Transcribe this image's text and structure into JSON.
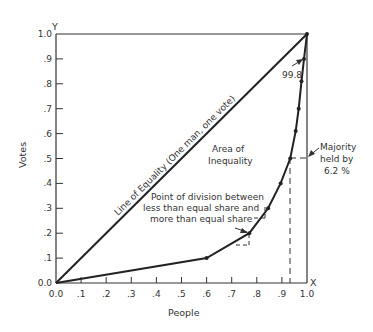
{
  "chart_data": {
    "type": "line",
    "title": "",
    "xlabel": "People",
    "ylabel": "Votes",
    "x_axis_letter": "X",
    "y_axis_letter": "Y",
    "xlim": [
      0,
      1
    ],
    "ylim": [
      0,
      1
    ],
    "grid": false,
    "x_ticks": [
      "0.0",
      ".1",
      ".2",
      ".3",
      ".4",
      ".5",
      ".6",
      ".7",
      ".8",
      ".9",
      "1.0"
    ],
    "y_ticks": [
      "0.0",
      ".1",
      ".2",
      ".3",
      ".4",
      ".5",
      ".6",
      ".7",
      ".8",
      ".9",
      "1.0"
    ],
    "series": [
      {
        "name": "Line of Equality (One man, one vote)",
        "x": [
          0,
          1
        ],
        "y": [
          0,
          1
        ]
      },
      {
        "name": "Lorenz curve of votes",
        "x": [
          0.0,
          0.6,
          0.77,
          0.845,
          0.895,
          0.933,
          0.955,
          0.967,
          0.978,
          0.988,
          1.0
        ],
        "y": [
          0.0,
          0.1,
          0.2,
          0.3,
          0.4,
          0.5,
          0.61,
          0.7,
          0.81,
          0.9,
          1.0
        ]
      }
    ],
    "annotations": [
      {
        "text": "99.8",
        "points_to": [
          0.99,
          0.9
        ]
      },
      {
        "text_lines": [
          "Area  of",
          "Inequality"
        ],
        "at": [
          0.62,
          0.6
        ]
      },
      {
        "text_lines": [
          "Point of division between",
          "less than equal share and",
          "more than equal share"
        ],
        "points_to": [
          0.77,
          0.2
        ]
      },
      {
        "text_lines": [
          "Majority",
          "held by",
          "6.2 %"
        ],
        "points_to": [
          1.0,
          0.5
        ],
        "guide_x": 0.933,
        "guide_y": 0.5
      }
    ]
  },
  "labels": {
    "equality_line": "Line of Equality (One man, one vote)",
    "area_line1": "Area  of",
    "area_line2": "Inequality",
    "division_line1": "Point of division between",
    "division_line2": "less than equal share and",
    "division_line3": "more than equal share",
    "majority_line1": "Majority",
    "majority_line2": "held by",
    "majority_line3": "6.2 %",
    "top_value": "99.8",
    "x_title": "People",
    "y_title": "Votes",
    "x_letter": "X",
    "y_letter": "Y"
  }
}
